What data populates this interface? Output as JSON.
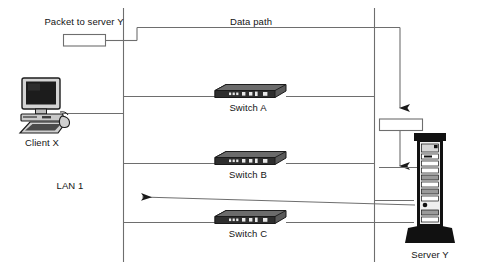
{
  "diagram": {
    "labels": {
      "packet_top": "Packet to server Y",
      "data_path": "Data path",
      "client": "Client X",
      "lan": "LAN 1",
      "switch_a": "Switch A",
      "switch_b": "Switch B",
      "switch_c": "Switch C",
      "server": "Server Y"
    },
    "colors": {
      "line": "#6e6e6e",
      "text": "#141414",
      "switch_top": "#5a5a5a",
      "switch_front": "#2e2e2e",
      "switch_port": "#e8e8e8",
      "server_body": "#111111",
      "server_panel": "#efefef",
      "server_slat": "#9a9a9a",
      "packet_fill": "#ffffff",
      "packet_stroke": "#6e6e6e",
      "monitor_dark": "#1c1c1c",
      "monitor_case": "#d4d4d4"
    },
    "nodes": [
      {
        "id": "packet-top",
        "kind": "packet",
        "label": "Packet to server Y"
      },
      {
        "id": "packet-right",
        "kind": "packet",
        "label": ""
      },
      {
        "id": "client-x",
        "kind": "workstation",
        "label": "Client X"
      },
      {
        "id": "switch-a",
        "kind": "switch",
        "label": "Switch A"
      },
      {
        "id": "switch-b",
        "kind": "switch",
        "label": "Switch B"
      },
      {
        "id": "switch-c",
        "kind": "switch",
        "label": "Switch C"
      },
      {
        "id": "server-y",
        "kind": "server",
        "label": "Server Y"
      }
    ],
    "flows": [
      {
        "id": "data-path-out",
        "label": "Data path",
        "direction": "down-right",
        "arrow": true
      },
      {
        "id": "server-ingress",
        "direction": "down",
        "arrow": true
      },
      {
        "id": "return-path",
        "direction": "left",
        "arrow": true
      }
    ]
  }
}
